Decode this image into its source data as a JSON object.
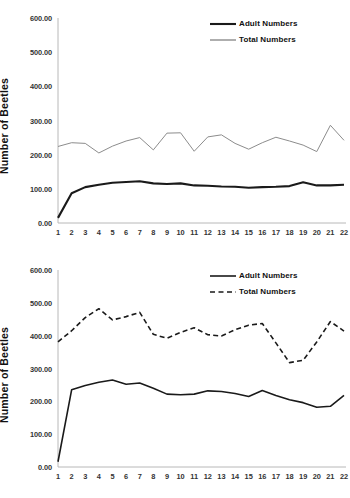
{
  "figure": {
    "panels": [
      "top",
      "bottom"
    ]
  },
  "chart_data": [
    {
      "id": "top",
      "type": "line",
      "title": "",
      "xlabel": "",
      "ylabel": "Number of Beetles",
      "ylim": [
        0,
        600
      ],
      "ytick_labels": [
        "0.00",
        "100.00",
        "200.00",
        "300.00",
        "400.00",
        "500.00",
        "600.00"
      ],
      "ytick_values": [
        0,
        100,
        200,
        300,
        400,
        500,
        600
      ],
      "grid": false,
      "legend_position": "top-right",
      "categories": [
        "1",
        "2",
        "3",
        "4",
        "5",
        "6",
        "7",
        "8",
        "9",
        "10",
        "11",
        "12",
        "13",
        "14",
        "15",
        "16",
        "17",
        "18",
        "19",
        "20",
        "21",
        "22"
      ],
      "series": [
        {
          "name": "Adult Numbers",
          "style": "solid",
          "color": "#1a1a1a",
          "width": 2.1,
          "values": [
            15,
            87,
            105,
            112,
            118,
            120,
            122,
            116,
            114,
            116,
            110,
            109,
            107,
            106,
            103,
            105,
            106,
            108,
            119,
            110,
            110,
            112
          ]
        },
        {
          "name": "Total Numbers",
          "style": "solid",
          "color": "#8c8c8c",
          "width": 1.0,
          "values": [
            224,
            235,
            233,
            205,
            225,
            240,
            250,
            214,
            263,
            264,
            210,
            252,
            258,
            233,
            216,
            235,
            251,
            240,
            228,
            209,
            286,
            242
          ]
        }
      ]
    },
    {
      "id": "bottom",
      "type": "line",
      "title": "",
      "xlabel": "",
      "ylabel": "Number of Beetles",
      "ylim": [
        0,
        600
      ],
      "ytick_labels": [
        "0.00",
        "100.00",
        "200.00",
        "300.00",
        "400.00",
        "500.00",
        "600.00"
      ],
      "ytick_values": [
        0,
        100,
        200,
        300,
        400,
        500,
        600
      ],
      "grid": false,
      "legend_position": "top-right",
      "categories": [
        "1",
        "2",
        "3",
        "4",
        "5",
        "6",
        "7",
        "8",
        "9",
        "10",
        "11",
        "12",
        "13",
        "14",
        "15",
        "16",
        "17",
        "18",
        "19",
        "20",
        "21",
        "22"
      ],
      "series": [
        {
          "name": "Adult Numbers",
          "style": "solid",
          "color": "#1a1a1a",
          "width": 1.6,
          "values": [
            16,
            235,
            248,
            258,
            265,
            252,
            256,
            240,
            222,
            220,
            222,
            232,
            230,
            224,
            215,
            233,
            218,
            205,
            196,
            182,
            185,
            218
          ]
        },
        {
          "name": "Total Numbers",
          "style": "dashed",
          "color": "#1a1a1a",
          "width": 1.6,
          "values": [
            381,
            415,
            455,
            482,
            448,
            458,
            471,
            404,
            392,
            410,
            424,
            403,
            399,
            418,
            432,
            437,
            378,
            318,
            325,
            381,
            443,
            414
          ]
        }
      ]
    }
  ]
}
